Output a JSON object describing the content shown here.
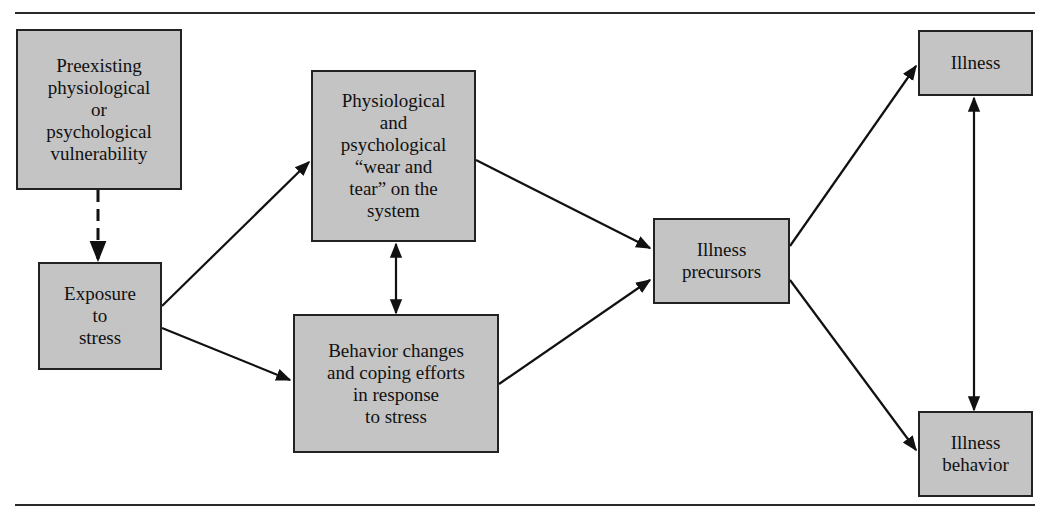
{
  "diagram": {
    "nodes": {
      "vulnerability": {
        "label": "Preexisting\nphysiological\nor\npsychological\nvulnerability"
      },
      "exposure": {
        "label": "Exposure\nto\nstress"
      },
      "wear_tear": {
        "label": "Physiological\nand\npsychological\n“wear and\ntear” on the\nsystem"
      },
      "behavior_changes": {
        "label": "Behavior changes\nand coping efforts\nin response\nto stress"
      },
      "precursors": {
        "label": "Illness\nprecursors"
      },
      "illness": {
        "label": "Illness"
      },
      "illness_behavior": {
        "label": "Illness\nbehavior"
      }
    },
    "edges": [
      {
        "from": "vulnerability",
        "to": "exposure",
        "style": "dashed"
      },
      {
        "from": "exposure",
        "to": "wear_tear",
        "style": "solid"
      },
      {
        "from": "exposure",
        "to": "behavior_changes",
        "style": "solid"
      },
      {
        "from": "wear_tear",
        "to": "behavior_changes",
        "style": "solid",
        "bidirectional": true
      },
      {
        "from": "wear_tear",
        "to": "precursors",
        "style": "solid"
      },
      {
        "from": "behavior_changes",
        "to": "precursors",
        "style": "solid"
      },
      {
        "from": "precursors",
        "to": "illness",
        "style": "solid"
      },
      {
        "from": "precursors",
        "to": "illness_behavior",
        "style": "solid"
      },
      {
        "from": "illness",
        "to": "illness_behavior",
        "style": "solid",
        "bidirectional": true
      }
    ],
    "colors": {
      "box_fill": "#c4c4c4",
      "stroke": "#222222"
    }
  }
}
